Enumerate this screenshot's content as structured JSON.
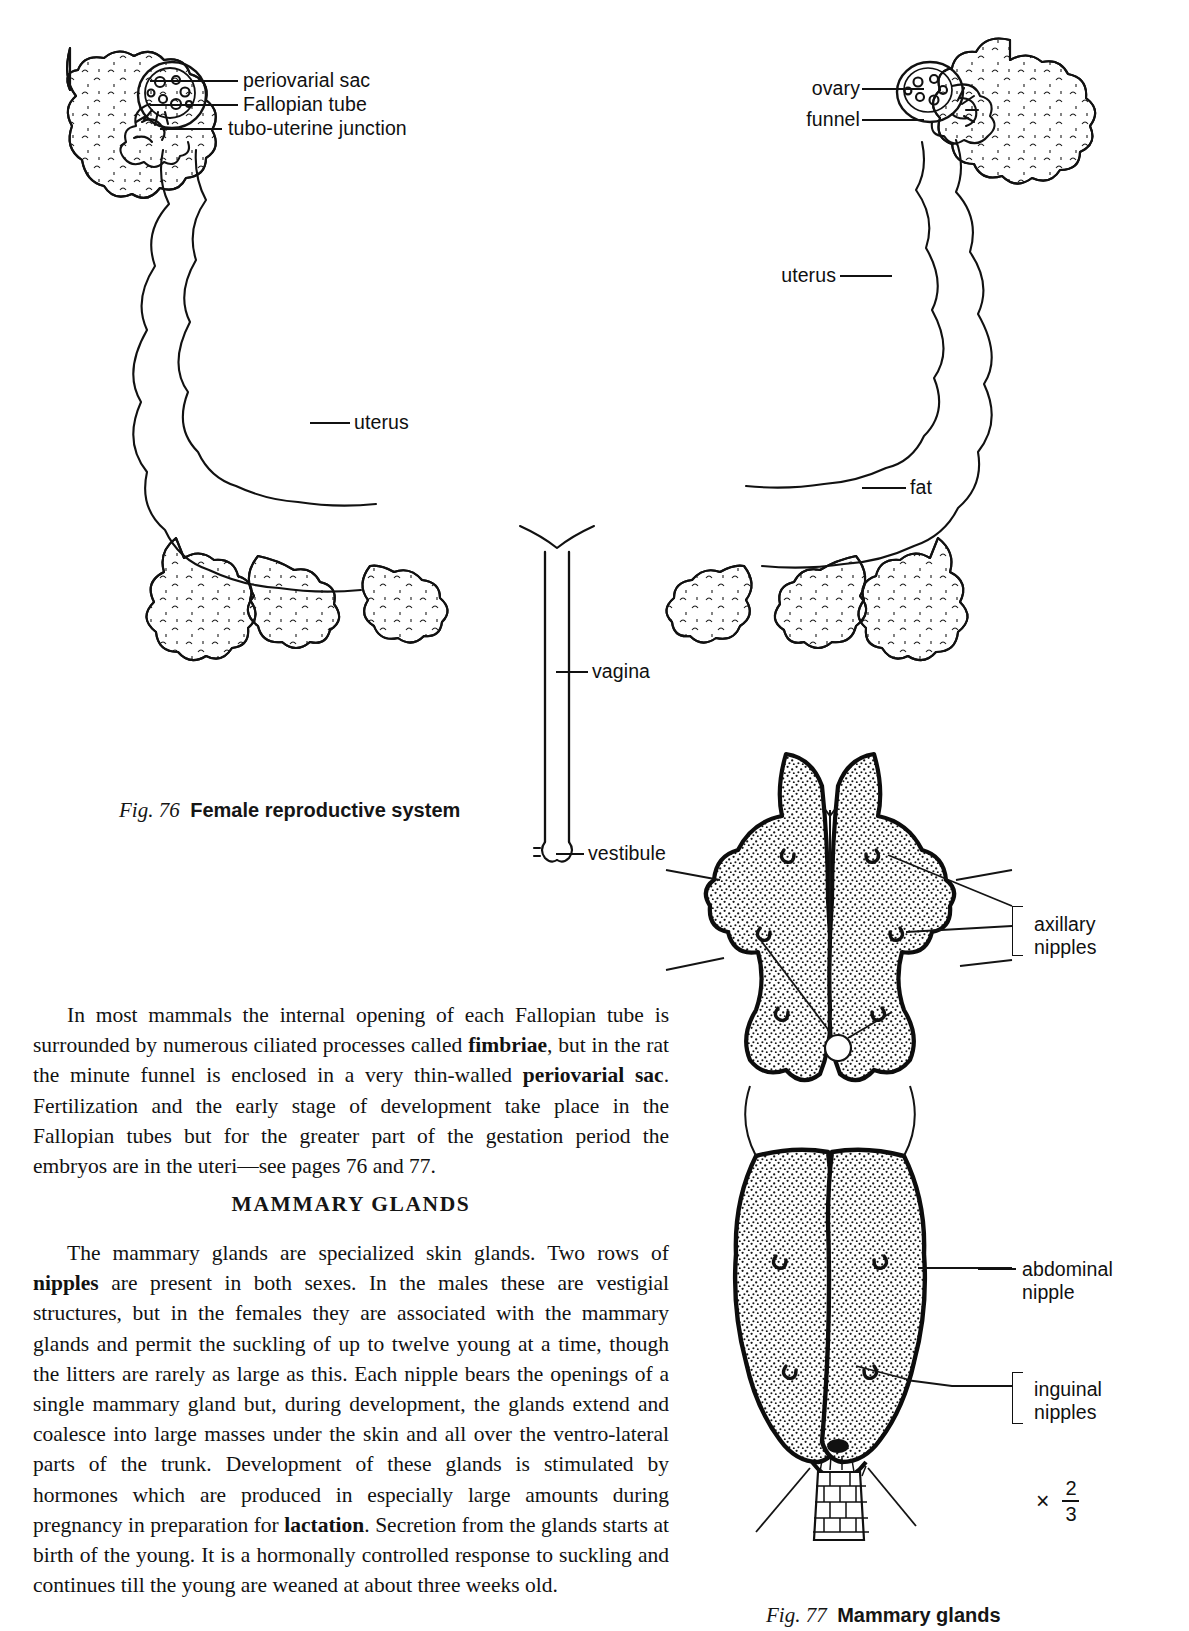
{
  "figure76": {
    "caption_prefix": "Fig. 76",
    "caption_title": "Female reproductive system",
    "labels": {
      "periovarial_sac": "periovarial sac",
      "fallopian_tube": "Fallopian tube",
      "tubo_uterine_junction": "tubo-uterine junction",
      "ovary": "ovary",
      "funnel": "funnel",
      "uterus_right": "uterus",
      "uterus_left": "uterus",
      "fat": "fat",
      "vagina": "vagina",
      "vestibule": "vestibule"
    }
  },
  "figure77": {
    "caption_prefix": "Fig. 77",
    "caption_title": "Mammary glands",
    "magnification_symbol": "×",
    "magnification_numerator": "2",
    "magnification_denominator": "3",
    "labels": {
      "axillary_line1": "axillary",
      "axillary_line2": "nipples",
      "abdominal_line1": "abdominal",
      "abdominal_line2": "nipple",
      "inguinal_line1": "inguinal",
      "inguinal_line2": "nipples"
    }
  },
  "body": {
    "paragraph1": {
      "t1": "In most mammals the internal opening of each Fallopian tube is surrounded by numerous ciliated processes called ",
      "b1": "fimbriae",
      "t2": ", but in the rat the minute funnel is enclosed in a very thin-walled ",
      "b2": "periovarial sac",
      "t3": ". Fertilization and the early stage of development take place in the Fallopian tubes but for the greater part of the gestation period the embryos are in the uteri—see pages 76 and 77."
    },
    "heading": "MAMMARY GLANDS",
    "paragraph2": {
      "t1": "The mammary glands are specialized skin glands.  Two rows of ",
      "b1": "nipples",
      "t2": " are present in both sexes.  In the males these are vestigial structures, but in the females they are associated with the mammary glands and permit the suckling of up to twelve young at a time, though the litters are rarely as large as this.  Each nipple bears the openings of a single mammary gland but, during development, the glands extend and coalesce into large masses under the skin and all over the ventro-lateral parts of the trunk.  Development of these glands is stimulated by hormones which are produced in especially large amounts during pregnancy in preparation for ",
      "b2": "lactation",
      "t3": ".  Secretion from the glands starts at birth of the young. It is a hormonally controlled response to suckling and continues till the young are weaned at about three weeks old."
    }
  }
}
